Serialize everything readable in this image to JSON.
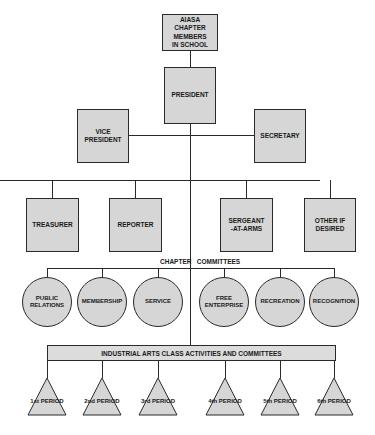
{
  "diagram": {
    "type": "organizational-chart",
    "root": "AIASA CHAPTER\nMEMBERS\nIN SCHOOL",
    "president": "PRESIDENT",
    "vice_president": "VICE\nPRESIDENT",
    "secretary": "SECRETARY",
    "officers": [
      {
        "label": "TREASURER"
      },
      {
        "label": "REPORTER"
      },
      {
        "label": "SERGEANT\n-AT-ARMS"
      },
      {
        "label": "OTHER IF\nDESIRED"
      }
    ],
    "committees_heading": "CHAPTER   COMMITTEES",
    "committees": [
      {
        "label": "PUBLIC\nRELATIONS"
      },
      {
        "label": "MEMBERSHIP"
      },
      {
        "label": "SERVICE"
      },
      {
        "label": "FREE\nENTERPRISE"
      },
      {
        "label": "RECREATION"
      },
      {
        "label": "RECOGNITION"
      }
    ],
    "class_activities": "INDUSTRIAL ARTS CLASS ACTIVITIES AND COMMITTEES",
    "periods": [
      {
        "label": "1st PERIOD"
      },
      {
        "label": "2nd PERIOD"
      },
      {
        "label": "3rd PERIOD"
      },
      {
        "label": "4th PERIOD"
      },
      {
        "label": "5th PERIOD"
      },
      {
        "label": "6th PERIOD"
      }
    ],
    "colors": {
      "fill": "#d6d6d6",
      "line": "#2a2a2a",
      "background": "#ffffff"
    }
  }
}
